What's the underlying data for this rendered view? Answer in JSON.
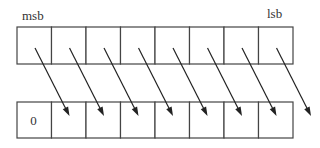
{
  "diagram": {
    "labels": {
      "msb": "msb",
      "lsb": "lsb"
    },
    "register_bits": 8,
    "top_row": {
      "values": [
        "",
        "",
        "",
        "",
        "",
        "",
        "",
        ""
      ]
    },
    "bottom_row": {
      "values": [
        "0",
        "",
        "",
        "",
        "",
        "",
        "",
        ""
      ]
    },
    "fill_value": "0",
    "colors": {
      "line": "#444444",
      "arrow": "#222222",
      "background": "#ffffff"
    }
  }
}
